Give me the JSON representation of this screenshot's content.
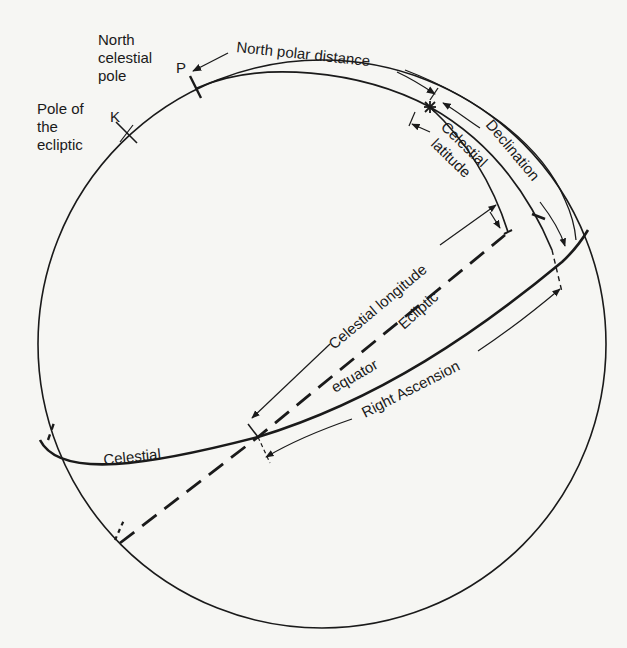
{
  "diagram": {
    "type": "celestial-sphere",
    "labels": {
      "north_celestial_pole_1": "North",
      "north_celestial_pole_2": "celestial",
      "north_celestial_pole_3": "pole",
      "pole_of_ecliptic_1": "Pole of",
      "pole_of_ecliptic_2": "the",
      "pole_of_ecliptic_3": "ecliptic",
      "point_p": "P",
      "point_k": "K",
      "north_polar_distance": "North polar distance",
      "declination": "Declination",
      "celestial_latitude_1": "Celestial",
      "celestial_latitude_2": "latitude",
      "celestial_longitude": "Celestial longitude",
      "ecliptic": "Ecliptic",
      "equator": "equator",
      "celestial": "Celestial",
      "right_ascension": "Right Ascension"
    },
    "colors": {
      "ink": "#1a1a1a",
      "paper": "#f6f6f3"
    }
  }
}
